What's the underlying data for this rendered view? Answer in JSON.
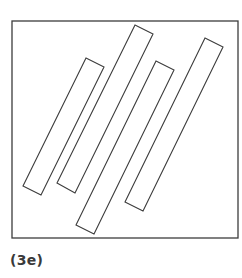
{
  "figure": {
    "caption": "(3e)",
    "stroke_color": "#3c3c3c",
    "frame": {
      "x": 12,
      "y": 21,
      "width": 226,
      "height": 217
    },
    "rectangles": [
      {
        "id": "bar-1",
        "points": "86,58 104,67 41,195 23,186"
      },
      {
        "id": "bar-2",
        "points": "135,25 153,34 75,193 57,183"
      },
      {
        "id": "bar-3",
        "points": "156,61 174,70 94,234 76,225"
      },
      {
        "id": "bar-4",
        "points": "205,38 223,47 143,211 125,202"
      }
    ]
  }
}
